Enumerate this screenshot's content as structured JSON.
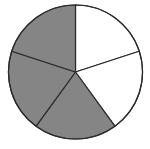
{
  "chart_data": {
    "type": "pie",
    "title": "",
    "categories": [
      "Slice 1",
      "Slice 2",
      "Slice 3",
      "Slice 4",
      "Slice 5"
    ],
    "values": [
      1,
      1,
      1,
      1,
      1
    ],
    "shaded": [
      false,
      false,
      true,
      true,
      true
    ],
    "fraction_shaded": "3/5",
    "start_angle_deg": 0,
    "direction": "clockwise",
    "center": [
      75.5,
      72
    ],
    "radius": 67,
    "legend": null
  },
  "colors": {
    "shaded": "#858585",
    "unshaded": "#ffffff",
    "stroke": "#2a2a2a"
  }
}
